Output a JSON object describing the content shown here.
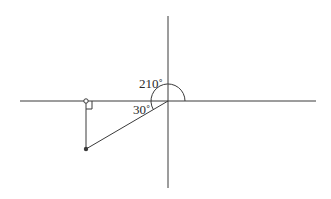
{
  "diagram": {
    "type": "reference-angle",
    "labels": {
      "angle": "210˚",
      "reference_angle": "30˚"
    },
    "angle_degrees": 210,
    "reference_angle_degrees": 30,
    "colors": {
      "line": "#3a3a3a",
      "background": "#ffffff"
    }
  }
}
